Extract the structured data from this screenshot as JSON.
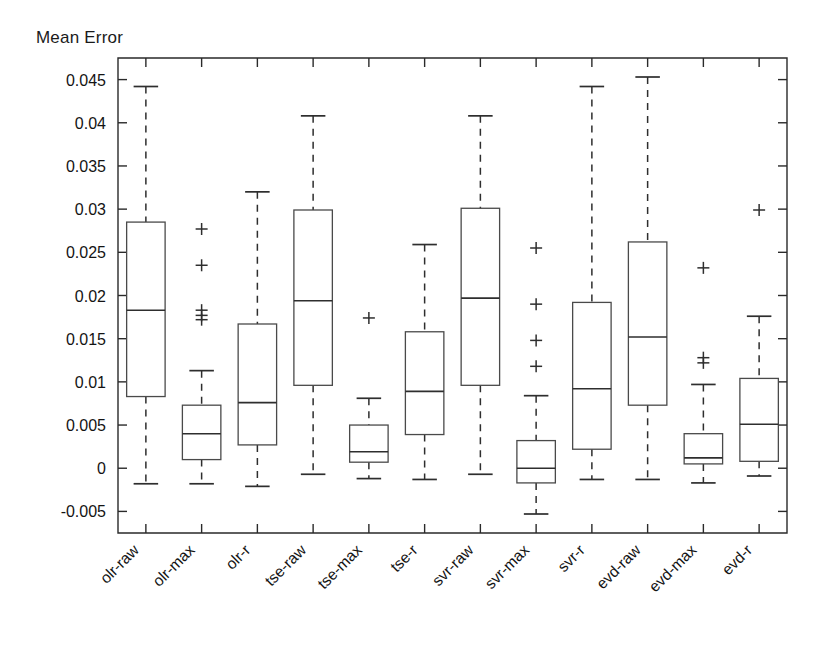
{
  "chart_data": {
    "type": "box",
    "title": "",
    "ylabel": "Mean Error",
    "xlabel": "",
    "ylim": [
      -0.0075,
      0.0475
    ],
    "grid": false,
    "legend": null,
    "ytick_labels": [
      "0.045",
      "0.04",
      "0.035",
      "0.03",
      "0.025",
      "0.02",
      "0.015",
      "0.01",
      "0.005",
      "0",
      "-0.005"
    ],
    "ytick_values": [
      0.045,
      0.04,
      0.035,
      0.03,
      0.025,
      0.02,
      0.015,
      0.01,
      0.005,
      0,
      -0.005
    ],
    "categories": [
      "olr-raw",
      "olr-max",
      "olr-r",
      "tse-raw",
      "tse-max",
      "tse-r",
      "svr-raw",
      "svr-max",
      "svr-r",
      "evd-raw",
      "evd-max",
      "evd-r"
    ],
    "boxes": [
      {
        "label": "olr-raw",
        "whisker_low": -0.0018,
        "q1": 0.0083,
        "median": 0.0183,
        "q3": 0.0285,
        "whisker_high": 0.0442,
        "outliers": []
      },
      {
        "label": "olr-max",
        "whisker_low": -0.0018,
        "q1": 0.001,
        "median": 0.004,
        "q3": 0.0073,
        "whisker_high": 0.0113,
        "outliers": [
          0.0277,
          0.0235,
          0.0183,
          0.0177,
          0.0172
        ]
      },
      {
        "label": "olr-r",
        "whisker_low": -0.0021,
        "q1": 0.0027,
        "median": 0.0076,
        "q3": 0.0167,
        "whisker_high": 0.032,
        "outliers": []
      },
      {
        "label": "tse-raw",
        "whisker_low": -0.0007,
        "q1": 0.0096,
        "median": 0.0194,
        "q3": 0.0299,
        "whisker_high": 0.0408,
        "outliers": []
      },
      {
        "label": "tse-max",
        "whisker_low": -0.0012,
        "q1": 0.0007,
        "median": 0.0019,
        "q3": 0.005,
        "whisker_high": 0.0081,
        "outliers": [
          0.0174
        ]
      },
      {
        "label": "tse-r",
        "whisker_low": -0.0013,
        "q1": 0.0039,
        "median": 0.0089,
        "q3": 0.0158,
        "whisker_high": 0.0259,
        "outliers": []
      },
      {
        "label": "svr-raw",
        "whisker_low": -0.0007,
        "q1": 0.0096,
        "median": 0.0197,
        "q3": 0.0301,
        "whisker_high": 0.0408,
        "outliers": []
      },
      {
        "label": "svr-max",
        "whisker_low": -0.0053,
        "q1": -0.0017,
        "median": 0.0,
        "q3": 0.0032,
        "whisker_high": 0.0084,
        "outliers": [
          0.0255,
          0.019,
          0.0148,
          0.0118
        ]
      },
      {
        "label": "svr-r",
        "whisker_low": -0.0013,
        "q1": 0.0022,
        "median": 0.0092,
        "q3": 0.0192,
        "whisker_high": 0.0442,
        "outliers": []
      },
      {
        "label": "evd-raw",
        "whisker_low": -0.0013,
        "q1": 0.0073,
        "median": 0.0152,
        "q3": 0.0262,
        "whisker_high": 0.0453,
        "outliers": []
      },
      {
        "label": "evd-max",
        "whisker_low": -0.0017,
        "q1": 0.0005,
        "median": 0.0012,
        "q3": 0.004,
        "whisker_high": 0.0097,
        "outliers": [
          0.0232,
          0.0128,
          0.0122
        ]
      },
      {
        "label": "evd-r",
        "whisker_low": -0.0009,
        "q1": 0.0008,
        "median": 0.0051,
        "q3": 0.0104,
        "whisker_high": 0.0176,
        "outliers": [
          0.0299
        ]
      }
    ]
  },
  "colors": {
    "axis": "#2a2a2a",
    "box_outline": "#4a4a4a",
    "median": "#2e2e2e",
    "whisker": "#2e2e2e",
    "background": "#ffffff"
  }
}
